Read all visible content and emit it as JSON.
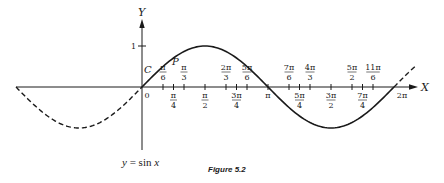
{
  "chart_data": {
    "type": "line",
    "title": "",
    "caption": "Figure 5.2",
    "equation_label": "y = sin x",
    "xlabel": "X",
    "ylabel": "Y",
    "xlim": [
      -3.14159,
      6.28318
    ],
    "ylim": [
      -1,
      1
    ],
    "grid": false,
    "legend": null,
    "series": [
      {
        "name": "y = sin x (solid)",
        "style": "solid",
        "x_range": [
          0,
          6.28318
        ],
        "function": "sin(x)"
      },
      {
        "name": "y = sin x (dashed, x<0)",
        "style": "dashed",
        "x_range": [
          -3.14159,
          0
        ],
        "function": "sin(x)"
      },
      {
        "name": "y = sin x (dashed, x>2pi)",
        "style": "dashed",
        "x_range": [
          6.28318,
          6.8
        ],
        "function": "sin(x)"
      }
    ],
    "y_ticks": [
      {
        "value": 1,
        "label": "1"
      }
    ],
    "x_ticks_above": [
      {
        "value": 0.5236,
        "num": "π",
        "den": "6"
      },
      {
        "value": 1.0472,
        "num": "π",
        "den": "3"
      },
      {
        "value": 2.0944,
        "num": "2π",
        "den": "3"
      },
      {
        "value": 2.618,
        "num": "5π",
        "den": "6"
      },
      {
        "value": 3.6652,
        "num": "7π",
        "den": "6"
      },
      {
        "value": 4.1888,
        "num": "4π",
        "den": "3"
      },
      {
        "value": 5.236,
        "num": "5π",
        "den": "2"
      },
      {
        "value": 5.7596,
        "num": "11π",
        "den": "6"
      }
    ],
    "x_ticks_below": [
      {
        "value": 0,
        "label": "0"
      },
      {
        "value": 0.7854,
        "num": "π",
        "den": "4"
      },
      {
        "value": 1.5708,
        "num": "π",
        "den": "2"
      },
      {
        "value": 2.3562,
        "num": "3π",
        "den": "4"
      },
      {
        "value": 3.14159,
        "label": "π"
      },
      {
        "value": 3.927,
        "num": "5π",
        "den": "4"
      },
      {
        "value": 4.7124,
        "num": "3π",
        "den": "2"
      },
      {
        "value": 5.4978,
        "num": "7π",
        "den": "4"
      },
      {
        "value": 6.28318,
        "label": "2π"
      }
    ],
    "annotations": [
      {
        "text": "C",
        "near": "origin arc"
      },
      {
        "text": "P",
        "near": "point on curve past π/6"
      }
    ]
  }
}
